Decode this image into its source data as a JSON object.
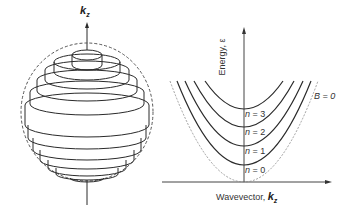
{
  "left_figure": {
    "axis_label": "k",
    "axis_subscript": "z",
    "description": "Landau cylinders inside Fermi sphere"
  },
  "right_figure": {
    "y_axis_label": "Energy, ε",
    "x_axis_label": "Wavevector,",
    "x_axis_symbol": "k",
    "x_axis_subscript": "z",
    "reference_curve_label": "B = 0",
    "levels": [
      {
        "n_label": "n",
        "n_value": "= 0"
      },
      {
        "n_label": "n",
        "n_value": "= 1"
      },
      {
        "n_label": "n",
        "n_value": "= 2"
      },
      {
        "n_label": "n",
        "n_value": "= 3"
      }
    ]
  },
  "colors": {
    "line": "#2a2a2a",
    "dashed": "#888888",
    "text": "#333333"
  }
}
